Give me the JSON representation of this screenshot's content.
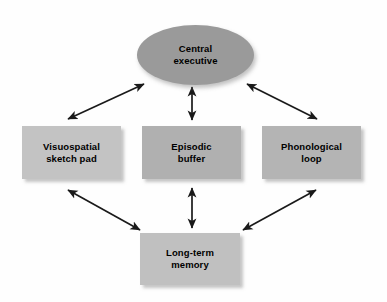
{
  "diagram": {
    "background_color": "#fefefe",
    "text_color": "#000000",
    "nodes": [
      {
        "id": "central-executive",
        "label": "Central\nexecutive",
        "shape": "ellipse",
        "fill": "#9a9a9a"
      },
      {
        "id": "visuospatial-sketch-pad",
        "label": "Visuospatial\nsketch pad",
        "shape": "rectangle",
        "fill": "#c3c3c3"
      },
      {
        "id": "episodic-buffer",
        "label": "Episodic\nbuffer",
        "shape": "rectangle",
        "fill": "#b0b0b0"
      },
      {
        "id": "phonological-loop",
        "label": "Phonological\nloop",
        "shape": "rectangle",
        "fill": "#b4b4b4"
      },
      {
        "id": "long-term-memory",
        "label": "Long-term\nmemory",
        "shape": "rectangle",
        "fill": "#c0c0c0"
      }
    ],
    "connectors": [
      {
        "id": "central-executive-to-visuospatial-sketch-pad",
        "from": "central-executive",
        "to": "visuospatial-sketch-pad",
        "style": "double-headed-arrow",
        "color": "#1a1a1a"
      },
      {
        "id": "central-executive-to-episodic-buffer",
        "from": "central-executive",
        "to": "episodic-buffer",
        "style": "double-headed-arrow",
        "color": "#1a1a1a"
      },
      {
        "id": "central-executive-to-phonological-loop",
        "from": "central-executive",
        "to": "phonological-loop",
        "style": "double-headed-arrow",
        "color": "#1a1a1a"
      },
      {
        "id": "visuospatial-sketch-pad-to-long-term-memory",
        "from": "visuospatial-sketch-pad",
        "to": "long-term-memory",
        "style": "double-headed-arrow",
        "color": "#1a1a1a"
      },
      {
        "id": "episodic-buffer-to-long-term-memory",
        "from": "episodic-buffer",
        "to": "long-term-memory",
        "style": "double-headed-arrow",
        "color": "#1a1a1a"
      },
      {
        "id": "phonological-loop-to-long-term-memory",
        "from": "phonological-loop",
        "to": "long-term-memory",
        "style": "double-headed-arrow",
        "color": "#1a1a1a"
      }
    ]
  }
}
